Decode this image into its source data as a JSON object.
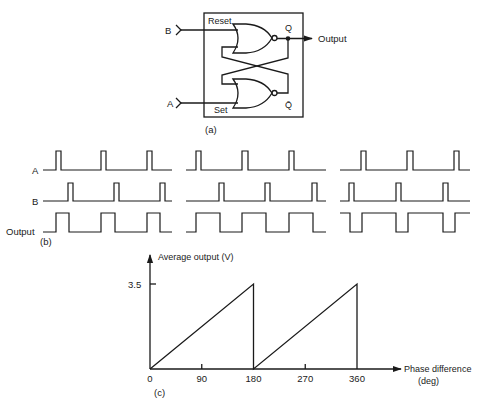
{
  "panel_a": {
    "caption": "(a)",
    "inputs": {
      "b_label": "B",
      "a_label": "A"
    },
    "pins": {
      "reset": "Reset",
      "set": "Set",
      "q": "Q",
      "qbar": "Q̄"
    },
    "output_label": "Output"
  },
  "panel_b": {
    "caption": "(b)",
    "row_labels": [
      "A",
      "B",
      "Output"
    ],
    "rows_y": {
      "A": [
        170,
        151
      ],
      "B": [
        201,
        183
      ],
      "Output": [
        232,
        213
      ]
    },
    "groups": [
      {
        "x_range": [
          43,
          172
        ],
        "A_pulses": [
          [
            56,
            61
          ],
          [
            101,
            106
          ],
          [
            147,
            152
          ]
        ],
        "B_pulses": [
          [
            68,
            73
          ],
          [
            114,
            119
          ],
          [
            160,
            165
          ]
        ],
        "Output_high": [
          [
            56,
            69
          ],
          [
            101,
            115
          ],
          [
            147,
            160
          ]
        ]
      },
      {
        "x_range": [
          186,
          326
        ],
        "A_pulses": [
          [
            196,
            201
          ],
          [
            242,
            248
          ],
          [
            289,
            294
          ]
        ],
        "B_pulses": [
          [
            219,
            224
          ],
          [
            265,
            270
          ],
          [
            312,
            317
          ]
        ],
        "Output_high": [
          [
            196,
            220
          ],
          [
            242,
            266
          ],
          [
            289,
            313
          ]
        ]
      },
      {
        "x_range": [
          340,
          470
        ],
        "A_pulses": [
          [
            361,
            366
          ],
          [
            407,
            413
          ],
          [
            454,
            459
          ]
        ],
        "B_pulses": [
          [
            349,
            354
          ],
          [
            396,
            401
          ],
          [
            443,
            448
          ]
        ],
        "Output_high": [
          [
            340,
            350
          ],
          [
            362,
            396
          ],
          [
            408,
            443
          ],
          [
            455,
            470
          ]
        ]
      }
    ]
  },
  "chart_data": {
    "type": "line",
    "title": "",
    "caption": "(c)",
    "xlabel": "Phase difference (deg)",
    "xlabel_line1": "Phase difference",
    "xlabel_line2": "(deg)",
    "ylabel": "Average output (V)",
    "x_ticks": [
      "0",
      "90",
      "180",
      "270",
      "360"
    ],
    "y_ticks": [
      "3.5"
    ],
    "xlim": [
      0,
      360
    ],
    "ylim": [
      0,
      3.5
    ],
    "grid": false,
    "series": [
      {
        "name": "Average output",
        "x": [
          0,
          180,
          180,
          360,
          360
        ],
        "y": [
          0,
          3.5,
          0,
          3.5,
          0
        ]
      }
    ]
  }
}
